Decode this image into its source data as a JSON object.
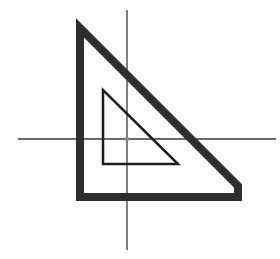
{
  "diagram": {
    "type": "geometric-scaling",
    "colors": {
      "background": "#ffffff",
      "axis": "#3a3a3a",
      "outer_triangle": "#2e2e2e",
      "inner_triangle": "#1e1e1e",
      "origin": "#8a8a8a"
    },
    "axes": {
      "horizontal": {
        "x1": 18,
        "y1": 139,
        "x2": 276,
        "y2": 139
      },
      "vertical": {
        "x1": 127,
        "y1": 10,
        "x2": 127,
        "y2": 250
      },
      "origin": {
        "x": 127,
        "y": 139
      }
    },
    "outer_triangle": {
      "points": [
        [
          80,
          28
        ],
        [
          80,
          197
        ],
        [
          238,
          197
        ],
        [
          238,
          186
        ]
      ],
      "stroke_width": 8
    },
    "inner_triangle": {
      "points": [
        [
          103,
          90
        ],
        [
          103,
          164
        ],
        [
          178,
          164
        ]
      ],
      "stroke_width": 2.5
    }
  }
}
